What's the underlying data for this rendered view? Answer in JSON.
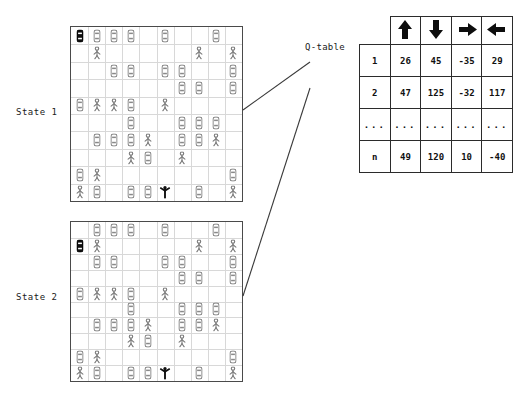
{
  "diagram": {
    "title_caption": "Q-table",
    "states": [
      {
        "label": "State 1"
      },
      {
        "label": "State 2"
      }
    ]
  },
  "qtable": {
    "caption": "Q-table",
    "action_headers": [
      {
        "name": "arrow-up-icon",
        "glyph": "↑",
        "label": "up"
      },
      {
        "name": "arrow-down-icon",
        "glyph": "↓",
        "label": "down"
      },
      {
        "name": "arrow-right-icon",
        "glyph": "→",
        "label": "right"
      },
      {
        "name": "arrow-left-icon",
        "glyph": "←",
        "label": "left"
      }
    ],
    "rows": [
      {
        "state": "1",
        "values": [
          "26",
          "45",
          "-35",
          "29"
        ]
      },
      {
        "state": "2",
        "values": [
          "47",
          "125",
          "-32",
          "117"
        ]
      },
      {
        "state": "...",
        "values": [
          "...",
          "...",
          "...",
          "..."
        ]
      },
      {
        "state": "n",
        "values": [
          "49",
          "120",
          "10",
          "-40"
        ]
      }
    ]
  },
  "chart_data": {
    "type": "table",
    "title": "Q-table",
    "categories": [
      "up",
      "down",
      "right",
      "left"
    ],
    "row_labels": [
      "1",
      "2",
      "...",
      "n"
    ],
    "series": [
      {
        "name": "1",
        "values": [
          26,
          45,
          -35,
          29
        ]
      },
      {
        "name": "2",
        "values": [
          47,
          125,
          -32,
          117
        ]
      },
      {
        "name": "n",
        "values": [
          49,
          120,
          10,
          -40
        ]
      }
    ],
    "xlabel": "action",
    "ylabel": "state",
    "grid": true,
    "legend": "none"
  },
  "colors": {
    "board_border": "#4a4a4a",
    "grid_line": "#d8d8d8",
    "table_border": "#2b2b2b",
    "text": "#111111",
    "agent_outline": "#5a5a5a",
    "ego_car": "#111111",
    "goal_person": "#111111"
  },
  "board1": {
    "name": "State 1 occupancy grid",
    "cols": 10,
    "rows": 10,
    "items": [
      {
        "kind": "car-ego",
        "col": 0,
        "row": 0
      },
      {
        "kind": "car",
        "col": 1,
        "row": 0
      },
      {
        "kind": "car",
        "col": 2,
        "row": 0
      },
      {
        "kind": "car",
        "col": 3,
        "row": 0
      },
      {
        "kind": "car",
        "col": 5,
        "row": 0
      },
      {
        "kind": "car",
        "col": 8,
        "row": 0
      },
      {
        "kind": "person",
        "col": 1,
        "row": 1
      },
      {
        "kind": "person",
        "col": 7,
        "row": 1
      },
      {
        "kind": "person",
        "col": 9,
        "row": 1
      },
      {
        "kind": "car",
        "col": 2,
        "row": 2
      },
      {
        "kind": "car",
        "col": 3,
        "row": 2
      },
      {
        "kind": "car",
        "col": 5,
        "row": 2
      },
      {
        "kind": "car",
        "col": 6,
        "row": 2
      },
      {
        "kind": "car",
        "col": 9,
        "row": 2
      },
      {
        "kind": "car",
        "col": 6,
        "row": 3
      },
      {
        "kind": "car",
        "col": 7,
        "row": 3
      },
      {
        "kind": "car",
        "col": 9,
        "row": 3
      },
      {
        "kind": "car",
        "col": 0,
        "row": 4
      },
      {
        "kind": "person",
        "col": 1,
        "row": 4
      },
      {
        "kind": "person",
        "col": 2,
        "row": 4
      },
      {
        "kind": "car",
        "col": 3,
        "row": 4
      },
      {
        "kind": "person",
        "col": 5,
        "row": 4
      },
      {
        "kind": "car",
        "col": 3,
        "row": 5
      },
      {
        "kind": "car",
        "col": 6,
        "row": 5
      },
      {
        "kind": "car",
        "col": 7,
        "row": 5
      },
      {
        "kind": "car",
        "col": 8,
        "row": 5
      },
      {
        "kind": "car",
        "col": 1,
        "row": 6
      },
      {
        "kind": "car",
        "col": 2,
        "row": 6
      },
      {
        "kind": "car",
        "col": 3,
        "row": 6
      },
      {
        "kind": "person",
        "col": 4,
        "row": 6
      },
      {
        "kind": "car",
        "col": 6,
        "row": 6
      },
      {
        "kind": "car",
        "col": 7,
        "row": 6
      },
      {
        "kind": "person",
        "col": 8,
        "row": 6
      },
      {
        "kind": "person",
        "col": 3,
        "row": 7
      },
      {
        "kind": "car",
        "col": 4,
        "row": 7
      },
      {
        "kind": "person",
        "col": 6,
        "row": 7
      },
      {
        "kind": "car",
        "col": 0,
        "row": 8
      },
      {
        "kind": "person",
        "col": 1,
        "row": 8
      },
      {
        "kind": "car",
        "col": 9,
        "row": 8
      },
      {
        "kind": "person",
        "col": 0,
        "row": 9
      },
      {
        "kind": "car",
        "col": 1,
        "row": 9
      },
      {
        "kind": "car",
        "col": 3,
        "row": 9
      },
      {
        "kind": "car",
        "col": 4,
        "row": 9
      },
      {
        "kind": "person-goal",
        "col": 5,
        "row": 9
      },
      {
        "kind": "car",
        "col": 7,
        "row": 9
      },
      {
        "kind": "person",
        "col": 9,
        "row": 9
      }
    ]
  },
  "board2": {
    "name": "State 2 occupancy grid",
    "cols": 10,
    "rows": 10,
    "items": [
      {
        "kind": "car",
        "col": 1,
        "row": 0
      },
      {
        "kind": "car",
        "col": 2,
        "row": 0
      },
      {
        "kind": "car",
        "col": 3,
        "row": 0
      },
      {
        "kind": "car",
        "col": 5,
        "row": 0
      },
      {
        "kind": "car",
        "col": 8,
        "row": 0
      },
      {
        "kind": "car-ego",
        "col": 0,
        "row": 1
      },
      {
        "kind": "person",
        "col": 1,
        "row": 1
      },
      {
        "kind": "person",
        "col": 7,
        "row": 1
      },
      {
        "kind": "person",
        "col": 9,
        "row": 1
      },
      {
        "kind": "car",
        "col": 1,
        "row": 2
      },
      {
        "kind": "car",
        "col": 2,
        "row": 2
      },
      {
        "kind": "car",
        "col": 5,
        "row": 2
      },
      {
        "kind": "car",
        "col": 6,
        "row": 2
      },
      {
        "kind": "car",
        "col": 9,
        "row": 2
      },
      {
        "kind": "car",
        "col": 6,
        "row": 3
      },
      {
        "kind": "car",
        "col": 7,
        "row": 3
      },
      {
        "kind": "car",
        "col": 9,
        "row": 3
      },
      {
        "kind": "car",
        "col": 0,
        "row": 4
      },
      {
        "kind": "person",
        "col": 1,
        "row": 4
      },
      {
        "kind": "person",
        "col": 2,
        "row": 4
      },
      {
        "kind": "car",
        "col": 3,
        "row": 4
      },
      {
        "kind": "person",
        "col": 5,
        "row": 4
      },
      {
        "kind": "car",
        "col": 3,
        "row": 5
      },
      {
        "kind": "car",
        "col": 6,
        "row": 5
      },
      {
        "kind": "car",
        "col": 7,
        "row": 5
      },
      {
        "kind": "car",
        "col": 8,
        "row": 5
      },
      {
        "kind": "car",
        "col": 1,
        "row": 6
      },
      {
        "kind": "car",
        "col": 2,
        "row": 6
      },
      {
        "kind": "car",
        "col": 3,
        "row": 6
      },
      {
        "kind": "person",
        "col": 4,
        "row": 6
      },
      {
        "kind": "car",
        "col": 6,
        "row": 6
      },
      {
        "kind": "car",
        "col": 7,
        "row": 6
      },
      {
        "kind": "person",
        "col": 8,
        "row": 6
      },
      {
        "kind": "person",
        "col": 3,
        "row": 7
      },
      {
        "kind": "car",
        "col": 4,
        "row": 7
      },
      {
        "kind": "person",
        "col": 6,
        "row": 7
      },
      {
        "kind": "car",
        "col": 0,
        "row": 8
      },
      {
        "kind": "person",
        "col": 1,
        "row": 8
      },
      {
        "kind": "car",
        "col": 9,
        "row": 8
      },
      {
        "kind": "person",
        "col": 0,
        "row": 9
      },
      {
        "kind": "car",
        "col": 1,
        "row": 9
      },
      {
        "kind": "car",
        "col": 3,
        "row": 9
      },
      {
        "kind": "car",
        "col": 4,
        "row": 9
      },
      {
        "kind": "person-goal",
        "col": 5,
        "row": 9
      },
      {
        "kind": "car",
        "col": 7,
        "row": 9
      },
      {
        "kind": "person",
        "col": 9,
        "row": 9
      }
    ]
  }
}
